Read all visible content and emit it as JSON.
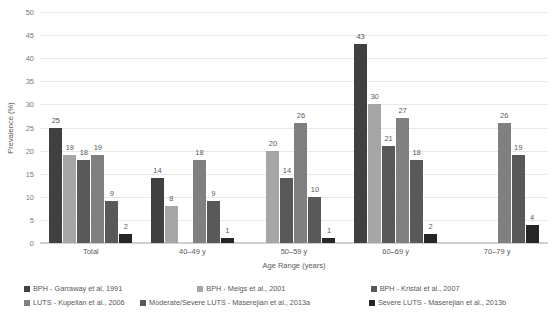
{
  "chart_data": {
    "type": "bar",
    "title": "",
    "xlabel": "Age Range (years)",
    "ylabel": "Prevalence (%)",
    "ylim": [
      0,
      50
    ],
    "ytick_step": 5,
    "yticks": [
      0,
      5,
      10,
      15,
      20,
      25,
      30,
      35,
      40,
      45,
      50
    ],
    "grid": true,
    "legend_position": "bottom",
    "categories": [
      "Total",
      "40–49 y",
      "50–59 y",
      "60–69 y",
      "70–79 y"
    ],
    "series": [
      {
        "name": "BPH - Garraway et al, 1991",
        "color": "#404040",
        "values": [
          25,
          14,
          null,
          43,
          null
        ]
      },
      {
        "name": "BPH - Meigs et al., 2001",
        "color": "#a6a6a6",
        "values": [
          19,
          8,
          20,
          30,
          null
        ]
      },
      {
        "name": "BPH - Kristal et al., 2007",
        "color": "#595959",
        "values": [
          18,
          null,
          14,
          21,
          null
        ]
      },
      {
        "name": "LUTS - Kupelian et al., 2006",
        "color": "#808080",
        "values": [
          19,
          18,
          26,
          27,
          26
        ]
      },
      {
        "name": "Moderate/Severe LUTS - Maserejian et al., 2013a",
        "color": "#595959",
        "values": [
          9,
          9,
          10,
          18,
          19
        ]
      },
      {
        "name": "Severe LUTS - Maserejian et al., 2013b",
        "color": "#262626",
        "values": [
          2,
          1,
          1,
          2,
          4
        ]
      }
    ]
  },
  "colors": {
    "background": "#ffffff",
    "grid": "#e8e8e8",
    "axis": "#d0d0d0",
    "text": "#595959",
    "tick_text": "#7b7b7b"
  }
}
